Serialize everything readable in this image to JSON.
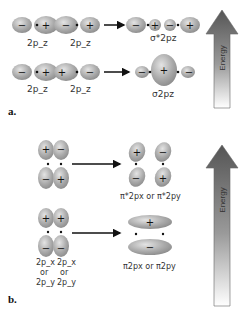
{
  "part_a": {
    "label": "a.",
    "row1": {
      "left_labels": [
        "2p_z",
        "2p_z"
      ],
      "left_signs": [
        "−",
        "+",
        "−",
        "+"
      ],
      "result_signs": [
        "−",
        "+",
        "−",
        "+"
      ],
      "result_label": "σ*2pz"
    },
    "row2": {
      "left_labels": [
        "2p_z",
        "2p_z"
      ],
      "left_signs": [
        "−",
        "+",
        "+",
        "−"
      ],
      "result_signs": [
        "−",
        "+",
        "−"
      ],
      "result_label": "σ2pz"
    },
    "energy_arrow_label": "Energy"
  },
  "part_b": {
    "label": "b.",
    "row1": {
      "left_signs": [
        "+",
        "−",
        "−",
        "+"
      ],
      "result_signs": [
        "+",
        "−",
        "−",
        "+"
      ],
      "result_label": "π*2px or π*2py"
    },
    "row2": {
      "left_signs": [
        "+",
        "+",
        "−",
        "−"
      ],
      "result_signs": [
        "+",
        "−"
      ],
      "result_label": "π2px or π2py",
      "left_labels": [
        "2p_x",
        "2p_x",
        "or",
        "or",
        "2p_y",
        "2p_y"
      ]
    },
    "energy_arrow_label": "Energy"
  },
  "colors": {
    "lobe_fill": "#a8a8a8",
    "lobe_highlight": "#dcdcdc",
    "arrow_dark": "#5c5c5c",
    "arrow_light": "#ffffff"
  }
}
